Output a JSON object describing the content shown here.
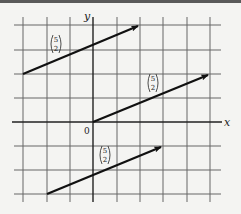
{
  "diagram": {
    "title": "",
    "axes": {
      "x_label": "x",
      "y_label": "y",
      "origin_label": "0"
    },
    "grid": {
      "x_min": -3,
      "x_max": 5,
      "y_min": -3,
      "y_max": 4
    },
    "vectors": [
      {
        "label_top": "5",
        "label_bottom": "2",
        "from": [
          -3,
          2
        ],
        "to": [
          2,
          4
        ]
      },
      {
        "label_top": "5",
        "label_bottom": "2",
        "from": [
          0,
          0
        ],
        "to": [
          5,
          2
        ]
      },
      {
        "label_top": "5",
        "label_bottom": "2",
        "from": [
          -2,
          -3
        ],
        "to": [
          3,
          -1
        ]
      }
    ],
    "colors": {
      "grid": "#555555",
      "vector": "#111111",
      "background": "#f4f4f2"
    }
  }
}
